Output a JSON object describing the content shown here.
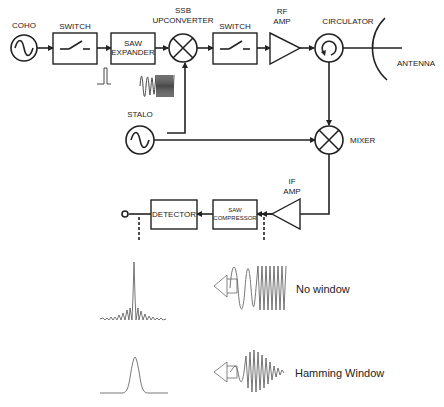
{
  "diagram": {
    "colors": {
      "line": "#222222",
      "background": "#ffffff",
      "waveform": "#555555"
    },
    "blocks": {
      "coho": {
        "label": "COHO",
        "icon": "sine-oscillator-icon"
      },
      "switch_tx": {
        "label": "SWITCH",
        "icon": "switch-icon"
      },
      "saw_expander": {
        "line1": "SAW",
        "line2": "EXPANDER"
      },
      "ssb_upconverter": {
        "line1": "SSB",
        "line2": "UPCONVERTER",
        "icon": "mixer-x-icon"
      },
      "switch_rf": {
        "label": "SWITCH",
        "icon": "switch-icon"
      },
      "rf_amp": {
        "line1": "RF",
        "line2": "AMP",
        "icon": "amplifier-triangle-icon"
      },
      "circulator": {
        "label": "CIRCULATOR",
        "icon": "circulator-arrow-icon"
      },
      "antenna": {
        "label": "ANTENNA",
        "icon": "antenna-dish-icon"
      },
      "stalo": {
        "label": "STALO",
        "icon": "sine-oscillator-icon"
      },
      "mixer": {
        "label": "MIXER",
        "icon": "mixer-x-icon"
      },
      "if_amp": {
        "line1": "IF",
        "line2": "AMP",
        "icon": "amplifier-triangle-icon"
      },
      "saw_compressor": {
        "line1": "SAW",
        "line2": "COMPRESSOR"
      },
      "detector": {
        "label": "DETECTOR"
      }
    },
    "insets": {
      "no_window": {
        "label": "No window"
      },
      "hamming_window": {
        "label": "Hamming Window"
      }
    }
  }
}
